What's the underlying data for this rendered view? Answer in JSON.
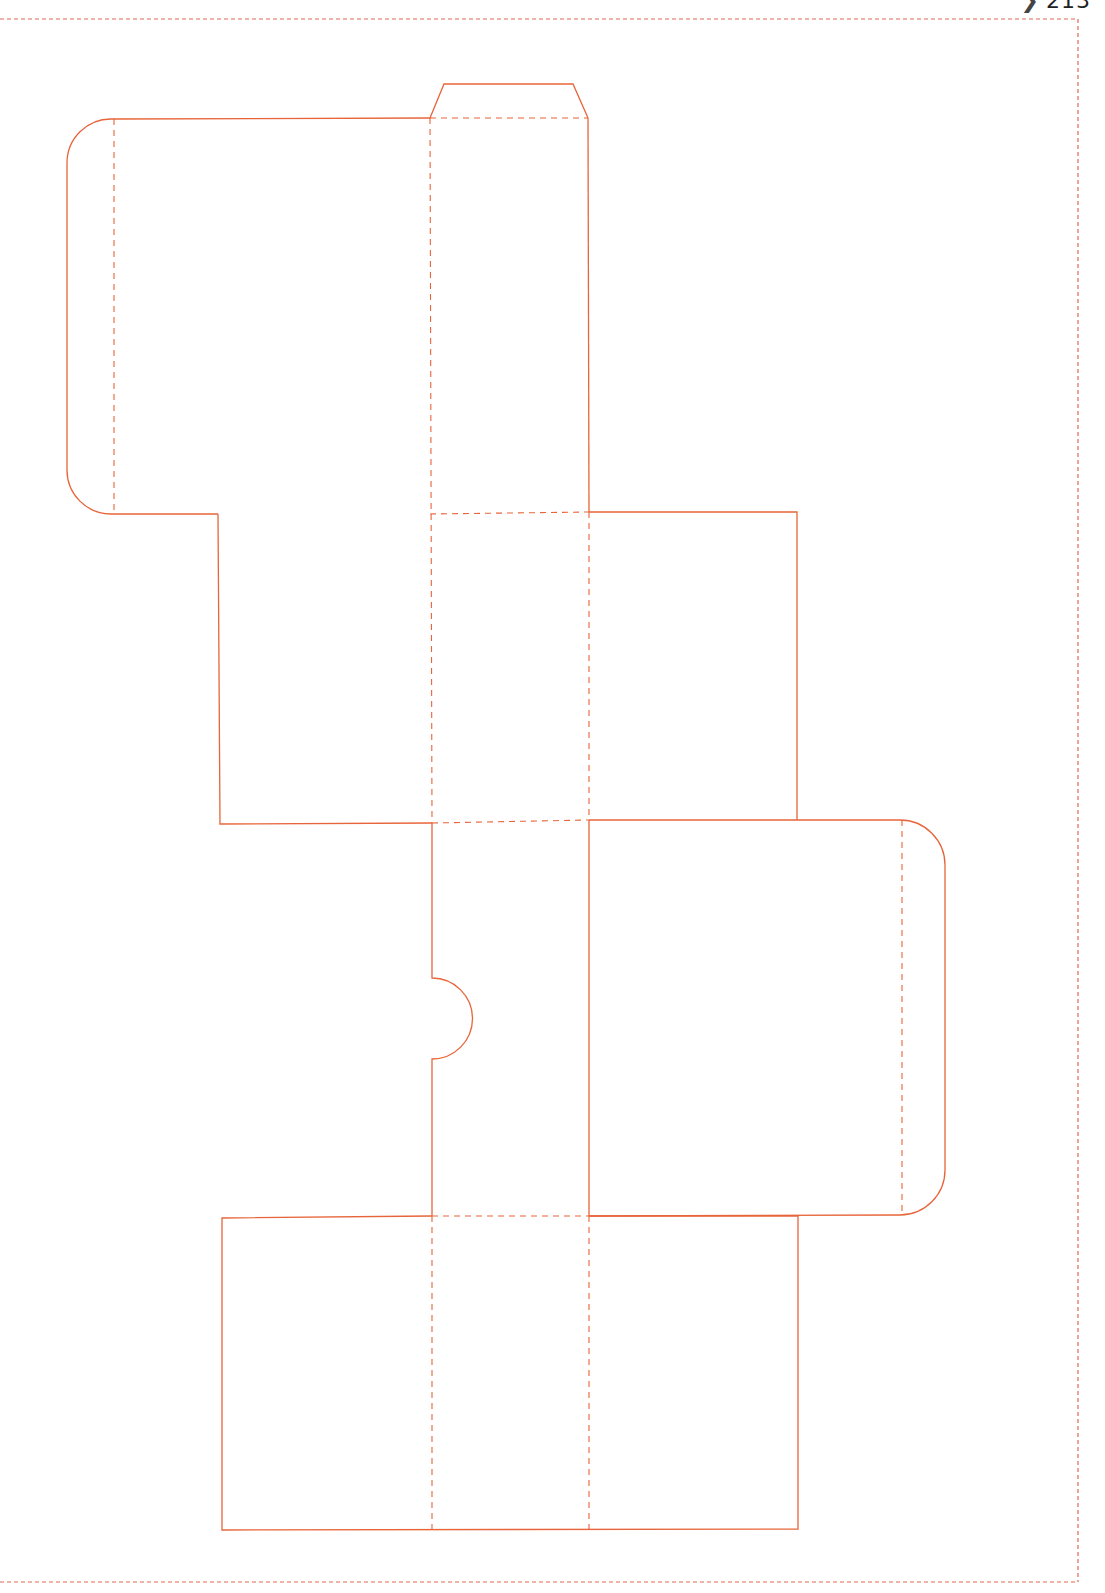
{
  "page": {
    "number_prefix": "❯",
    "number": "213"
  },
  "template": {
    "description": "Printable box net / die-cut template",
    "colors": {
      "cut_line": "#e8643a",
      "fold_line": "#e8643a",
      "page_border": "#e06a50"
    },
    "legend": {
      "solid": "cut line",
      "dashed": "fold line"
    }
  }
}
